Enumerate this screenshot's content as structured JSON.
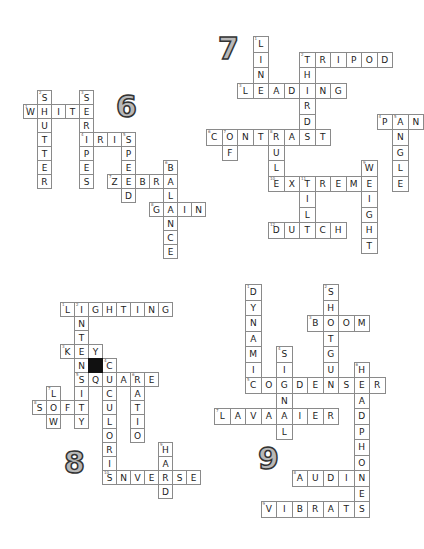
{
  "puzzles": [
    {
      "id": "6",
      "label": "6",
      "label_pos": [
        116,
        92
      ],
      "origin": [
        9,
        90
      ],
      "cell": 14,
      "words": [
        {
          "num": "1",
          "text": "WHITE",
          "dir": "across",
          "row": 1,
          "col": 1
        },
        {
          "num": "2",
          "text": "SHUTTER",
          "dir": "down",
          "row": 0,
          "col": 2
        },
        {
          "num": "3",
          "text": "STRIPES",
          "dir": "down",
          "row": 0,
          "col": 5
        },
        {
          "num": "4",
          "text": "IRIS",
          "dir": "across",
          "row": 3,
          "col": 5
        },
        {
          "num": "5",
          "text": "SPEED",
          "dir": "down",
          "row": 3,
          "col": 8
        },
        {
          "num": "6",
          "text": "BALANCE",
          "dir": "down",
          "row": 5,
          "col": 11
        },
        {
          "num": "7",
          "text": "ZEBRA",
          "dir": "across",
          "row": 6,
          "col": 7
        },
        {
          "num": "8",
          "text": "GAIN",
          "dir": "across",
          "row": 8,
          "col": 10
        }
      ]
    },
    {
      "id": "7",
      "label": "7",
      "label_pos": [
        218,
        34
      ],
      "origin": [
        206,
        36
      ],
      "cell": 15.5,
      "words": [
        {
          "num": "1",
          "text": "LIN",
          "dir": "down",
          "row": 0,
          "col": 3
        },
        {
          "num": "2",
          "text": "TRIPOD",
          "dir": "across",
          "row": 1,
          "col": 6
        },
        {
          "num": "2",
          "text": "THIRD",
          "dir": "down",
          "row": 1,
          "col": 6
        },
        {
          "num": "3",
          "text": "LEADING",
          "dir": "across",
          "row": 3,
          "col": 2
        },
        {
          "num": "4",
          "text": "PAN",
          "dir": "across",
          "row": 5,
          "col": 11
        },
        {
          "num": "5",
          "text": "ANGLE",
          "dir": "down",
          "row": 5,
          "col": 12
        },
        {
          "num": "6",
          "text": "CONTRAST",
          "dir": "across",
          "row": 6,
          "col": 0
        },
        {
          "num": "7",
          "text": "OF",
          "dir": "down",
          "row": 6,
          "col": 1
        },
        {
          "num": "8",
          "text": "RUL",
          "dir": "down",
          "row": 6,
          "col": 4
        },
        {
          "num": "9",
          "text": "WEIGHT",
          "dir": "down",
          "row": 8,
          "col": 10
        },
        {
          "num": "10",
          "text": "EXTREME",
          "dir": "across",
          "row": 9,
          "col": 4
        },
        {
          "num": "11",
          "text": "TILT",
          "dir": "down",
          "row": 9,
          "col": 6
        },
        {
          "num": "12",
          "text": "DUTCH",
          "dir": "across",
          "row": 12,
          "col": 4
        }
      ]
    },
    {
      "id": "8",
      "label": "8",
      "label_pos": [
        64,
        448
      ],
      "origin": [
        18,
        302
      ],
      "cell": 14,
      "words": [
        {
          "num": "1",
          "text": "LIGHTING",
          "dir": "across",
          "row": 0,
          "col": 3
        },
        {
          "num": "2",
          "text": "INTENSITY",
          "dir": "down",
          "row": 0,
          "col": 4
        },
        {
          "num": "3",
          "text": "KEY",
          "dir": "across",
          "row": 3,
          "col": 3
        },
        {
          "num": "4",
          "text": "CUCULORIS",
          "dir": "down",
          "row": 4,
          "col": 6
        },
        {
          "num": "5",
          "text": "SQUARE",
          "dir": "across",
          "row": 5,
          "col": 4
        },
        {
          "num": "6",
          "text": "RATIO",
          "dir": "down",
          "row": 5,
          "col": 8
        },
        {
          "num": "7",
          "text": "LOW",
          "dir": "down",
          "row": 6,
          "col": 2
        },
        {
          "num": "8",
          "text": "SOFT",
          "dir": "across",
          "row": 7,
          "col": 1
        },
        {
          "num": "9",
          "text": "HARD",
          "dir": "down",
          "row": 10,
          "col": 10
        },
        {
          "num": "10",
          "text": "INVERSE",
          "dir": "across",
          "row": 12,
          "col": 6
        }
      ],
      "black_cells": [
        [
          4,
          5
        ]
      ]
    },
    {
      "id": "9",
      "label": "9",
      "label_pos": [
        258,
        444
      ],
      "origin": [
        214,
        284
      ],
      "cell": 15.5,
      "words": [
        {
          "num": "1",
          "text": "DYNAMI",
          "dir": "down",
          "row": 0,
          "col": 2
        },
        {
          "num": "2",
          "text": "SHOTGUN",
          "dir": "down",
          "row": 0,
          "col": 7
        },
        {
          "num": "3",
          "text": "BOOM",
          "dir": "across",
          "row": 2,
          "col": 6
        },
        {
          "num": "4",
          "text": "SIGNAL",
          "dir": "down",
          "row": 4,
          "col": 4
        },
        {
          "num": "5",
          "text": "CONDENSER",
          "dir": "across",
          "row": 6,
          "col": 2
        },
        {
          "num": "6",
          "text": "HEADPHONES",
          "dir": "down",
          "row": 5,
          "col": 9
        },
        {
          "num": "7",
          "text": "LAVALIER",
          "dir": "across",
          "row": 8,
          "col": 0
        },
        {
          "num": "8",
          "text": "AUDIO",
          "dir": "across",
          "row": 12,
          "col": 5
        },
        {
          "num": "9",
          "text": "VIBRATE",
          "dir": "across",
          "row": 14,
          "col": 3
        }
      ]
    }
  ]
}
